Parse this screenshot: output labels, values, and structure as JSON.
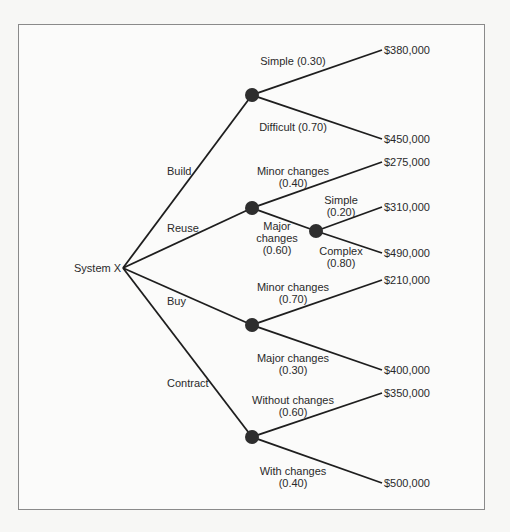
{
  "diagram": {
    "type": "decision-tree",
    "root": {
      "label": "System X",
      "x": 123,
      "y": 268
    },
    "frame": {
      "x": 18,
      "y": 24,
      "w": 466,
      "h": 485
    },
    "colors": {
      "line": "#1e1e1e",
      "node": "#2e2e2e",
      "text": "#2a2a2a",
      "frame": "#8a8a8a",
      "background": "#f7f7f5"
    },
    "nodes": [
      {
        "id": "build",
        "x": 252,
        "y": 95
      },
      {
        "id": "reuse",
        "x": 252,
        "y": 208
      },
      {
        "id": "reuse_major",
        "x": 316,
        "y": 231
      },
      {
        "id": "buy",
        "x": 252,
        "y": 325
      },
      {
        "id": "contract",
        "x": 252,
        "y": 437
      }
    ],
    "edges": [
      {
        "from": [
          123,
          268
        ],
        "to": [
          252,
          95
        ]
      },
      {
        "from": [
          123,
          268
        ],
        "to": [
          252,
          208
        ]
      },
      {
        "from": [
          123,
          268
        ],
        "to": [
          252,
          325
        ]
      },
      {
        "from": [
          123,
          268
        ],
        "to": [
          252,
          437
        ]
      },
      {
        "from": [
          252,
          95
        ],
        "to": [
          382,
          50
        ]
      },
      {
        "from": [
          252,
          95
        ],
        "to": [
          382,
          139
        ]
      },
      {
        "from": [
          252,
          208
        ],
        "to": [
          382,
          162
        ]
      },
      {
        "from": [
          252,
          208
        ],
        "to": [
          316,
          231
        ]
      },
      {
        "from": [
          316,
          231
        ],
        "to": [
          382,
          207
        ]
      },
      {
        "from": [
          316,
          231
        ],
        "to": [
          382,
          253
        ]
      },
      {
        "from": [
          252,
          325
        ],
        "to": [
          382,
          280
        ]
      },
      {
        "from": [
          252,
          325
        ],
        "to": [
          382,
          370
        ]
      },
      {
        "from": [
          252,
          437
        ],
        "to": [
          382,
          393
        ]
      },
      {
        "from": [
          252,
          437
        ],
        "to": [
          382,
          483
        ]
      }
    ],
    "labels": {
      "root": "System X",
      "build": "Build",
      "reuse": "Reuse",
      "buy": "Buy",
      "contract": "Contract",
      "build_simple": "Simple (0.30)",
      "build_difficult": "Difficult (0.70)",
      "reuse_minor_1": "Minor changes",
      "reuse_minor_2": "(0.40)",
      "reuse_major_1": "Major",
      "reuse_major_2": "changes",
      "reuse_major_3": "(0.60)",
      "major_simple_1": "Simple",
      "major_simple_2": "(0.20)",
      "major_complex_1": "Complex",
      "major_complex_2": "(0.80)",
      "buy_minor_1": "Minor changes",
      "buy_minor_2": "(0.70)",
      "buy_major_1": "Major changes",
      "buy_major_2": "(0.30)",
      "contract_without_1": "Without changes",
      "contract_without_2": "(0.60)",
      "contract_with_1": "With changes",
      "contract_with_2": "(0.40)"
    },
    "outcomes": {
      "build_simple": "$380,000",
      "build_difficult": "$450,000",
      "reuse_minor": "$275,000",
      "reuse_major_simple": "$310,000",
      "reuse_major_complex": "$490,000",
      "buy_minor": "$210,000",
      "buy_major": "$400,000",
      "contract_without": "$350,000",
      "contract_with": "$500,000"
    }
  }
}
